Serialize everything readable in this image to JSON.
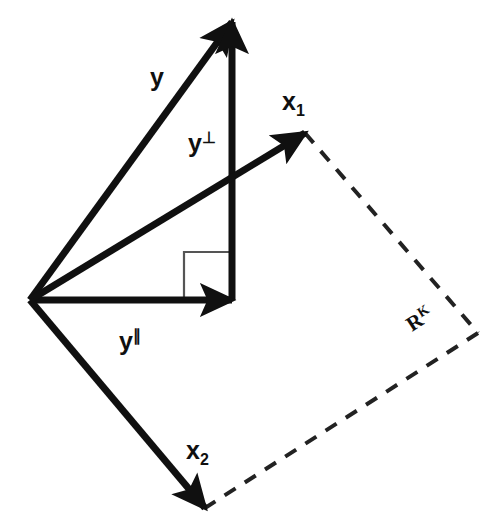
{
  "figure": {
    "background_color": "#ffffff",
    "stroke_color": "#101010",
    "dash_color": "#222222",
    "thin_color": "#555555"
  },
  "labels": {
    "y": {
      "base": "y",
      "sup": "",
      "sub": ""
    },
    "y_perp": {
      "base": "y",
      "sup": "⊥",
      "sub": ""
    },
    "y_par": {
      "base": "y",
      "sup": "∥",
      "sub": ""
    },
    "x1": {
      "base": "x",
      "sup": "",
      "sub": "1"
    },
    "x2": {
      "base": "x",
      "sup": "",
      "sub": "2"
    },
    "space": {
      "base": "R",
      "sup": "K",
      "sub": ""
    }
  },
  "geometry": {
    "origin": {
      "x": 30,
      "y": 300
    },
    "y_tip": {
      "x": 232,
      "y": 22
    },
    "y_perp_foot": {
      "x": 232,
      "y": 300
    },
    "y_par_tip": {
      "x": 232,
      "y": 300
    },
    "x1_tip": {
      "x": 305,
      "y": 133
    },
    "x2_tip": {
      "x": 205,
      "y": 508
    },
    "far_corner": {
      "x": 478,
      "y": 333
    },
    "right_angle_size": 48
  },
  "annotations": {
    "right_angle_marker": "right-angle",
    "dashed_region": "span-of-x1-x2"
  }
}
